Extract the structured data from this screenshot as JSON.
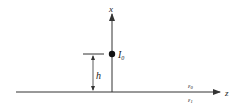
{
  "diagram": {
    "axes": {
      "vertical_label": "x",
      "horizontal_label": "z"
    },
    "source": {
      "label": "I",
      "subscript": "0"
    },
    "height_label": "h",
    "media": {
      "upper": {
        "symbol": "ε",
        "subscript": "0"
      },
      "lower": {
        "symbol": "ε",
        "subscript": "1"
      }
    },
    "colors": {
      "line": "#333333",
      "text": "#222222"
    }
  }
}
